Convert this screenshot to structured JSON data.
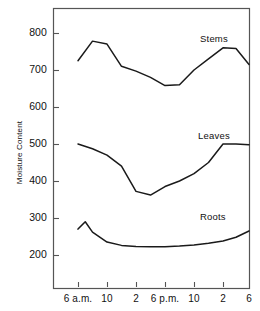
{
  "chart_data": {
    "type": "line",
    "title": "",
    "xlabel": "",
    "ylabel": "Moisture Content",
    "ylim": [
      150,
      860
    ],
    "xlim": [
      0,
      8
    ],
    "grid": false,
    "legend_position": "inline-labels",
    "y_ticks": [
      200,
      300,
      400,
      500,
      600,
      700,
      800
    ],
    "y_tick_labels": [
      "200",
      "300",
      "400",
      "500",
      "600",
      "700",
      "800"
    ],
    "x_ticks": [
      1,
      2,
      3,
      4,
      5,
      6,
      7
    ],
    "x_tick_labels": [
      "6 a.m.",
      "10",
      "2",
      "6 p.m.",
      "10",
      "2",
      "6"
    ],
    "series": [
      {
        "name": "Stems",
        "x": [
          1.0,
          1.5,
          2.0,
          2.5,
          3.0,
          3.5,
          4.0,
          4.5,
          5.0,
          5.5,
          6.0,
          6.5,
          7.0
        ],
        "values": [
          725,
          778,
          770,
          710,
          697,
          680,
          658,
          660,
          700,
          730,
          760,
          758,
          715
        ]
      },
      {
        "name": "Leaves",
        "x": [
          1.0,
          1.5,
          2.0,
          2.5,
          3.0,
          3.5,
          4.0,
          4.5,
          5.0,
          5.5,
          6.0,
          6.5,
          7.0
        ],
        "values": [
          500,
          487,
          470,
          440,
          372,
          362,
          385,
          400,
          420,
          450,
          500,
          500,
          498
        ]
      },
      {
        "name": "Roots",
        "x": [
          1.0,
          1.25,
          1.5,
          2.0,
          2.5,
          3.0,
          3.5,
          4.0,
          4.5,
          5.0,
          5.5,
          6.0,
          6.5,
          7.0
        ],
        "values": [
          270,
          290,
          262,
          235,
          226,
          223,
          222,
          222,
          224,
          227,
          232,
          238,
          248,
          265
        ]
      }
    ],
    "series_label_positions": [
      {
        "name": "Stems",
        "left": 200,
        "top": 33
      },
      {
        "name": "Leaves",
        "left": 198,
        "top": 130
      },
      {
        "name": "Roots",
        "left": 200,
        "top": 211
      }
    ],
    "colors": {
      "line": "#1a1a1a",
      "frame": "#555555",
      "text": "#111111"
    }
  },
  "plot_geometry": {
    "frame_left": 53,
    "frame_right": 249,
    "frame_top": 8,
    "frame_bottom": 288,
    "y_value_min": 200,
    "y_value_max": 800,
    "y_pixel_at_min": 255,
    "y_pixel_at_max": 33,
    "x_tick_pixels": [
      78,
      107,
      136,
      165,
      194,
      223,
      249
    ]
  }
}
